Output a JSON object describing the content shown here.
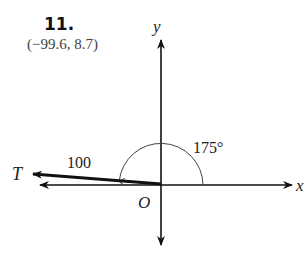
{
  "problem": {
    "number": "11.",
    "answer": "(−99.6, 8.7)"
  },
  "diagram": {
    "axis_x_label": "x",
    "axis_y_label": "y",
    "origin_label": "O",
    "vector_label": "T",
    "magnitude_label": "100",
    "angle_label": "175°",
    "magnitude": 100,
    "angle_deg": 175,
    "components": {
      "x": -99.6,
      "y": 8.7
    }
  }
}
